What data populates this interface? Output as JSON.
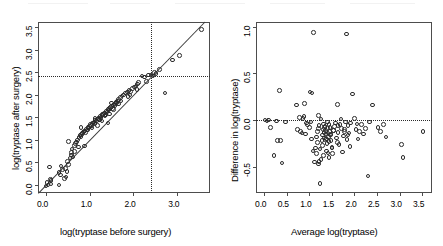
{
  "figure": {
    "title": "",
    "panels": [
      "scatter-before-after",
      "bland-altman"
    ]
  },
  "chart_data": [
    {
      "type": "scatter",
      "title": "",
      "xlabel": "log(tryptase before surgery)",
      "ylabel": "log(tryptase after surgery)",
      "xlim": [
        -0.18,
        3.75
      ],
      "ylim": [
        -0.18,
        3.62
      ],
      "xticks": [
        "0.0",
        "1.0",
        "2.0",
        "3.0"
      ],
      "xtick_values": [
        0.0,
        1.0,
        2.0,
        3.0
      ],
      "yticks": [
        "0.0",
        "0.5",
        "1.0",
        "1.5",
        "2.0",
        "2.5",
        "3.0",
        "3.5"
      ],
      "ytick_values": [
        0.0,
        0.5,
        1.0,
        1.5,
        2.0,
        2.5,
        3.0,
        3.5
      ],
      "grid": false,
      "legend": "none",
      "reference_lines": {
        "identity_line": {
          "slope": 1,
          "intercept": 0,
          "style": "solid"
        },
        "vertical_threshold": {
          "x": 2.4,
          "style": "dotted"
        },
        "horizontal_threshold": {
          "y": 2.43,
          "style": "dotted"
        }
      },
      "x": [
        0.0,
        0.03,
        0.05,
        0.08,
        0.1,
        0.12,
        0.3,
        0.33,
        0.38,
        0.42,
        0.45,
        0.48,
        0.5,
        0.52,
        0.55,
        0.58,
        0.6,
        0.62,
        0.65,
        0.68,
        0.7,
        0.72,
        0.74,
        0.76,
        0.78,
        0.8,
        0.82,
        0.84,
        0.86,
        0.88,
        0.9,
        0.92,
        0.94,
        0.96,
        0.98,
        1.0,
        1.02,
        1.04,
        1.06,
        1.08,
        1.1,
        1.12,
        1.14,
        1.16,
        1.18,
        1.2,
        1.22,
        1.24,
        1.26,
        1.28,
        1.3,
        1.32,
        1.34,
        1.36,
        1.38,
        1.4,
        1.42,
        1.44,
        1.46,
        1.48,
        1.5,
        1.52,
        1.54,
        1.56,
        1.58,
        1.6,
        1.62,
        1.64,
        1.66,
        1.7,
        1.74,
        1.78,
        1.82,
        1.86,
        1.9,
        1.94,
        1.98,
        2.02,
        2.06,
        2.1,
        2.2,
        2.3,
        2.4,
        2.45,
        2.52,
        2.6,
        2.72,
        2.9,
        3.05,
        3.55,
        0.52,
        0.8,
        1.12,
        1.5,
        1.22,
        0.95,
        1.05,
        1.35,
        1.62,
        2.12,
        0.35,
        0.66,
        1.45,
        1.72,
        2.26,
        0.58,
        1.28,
        1.55,
        1.88,
        2.34,
        0.46,
        0.88,
        1.18,
        1.42,
        1.66,
        1.92,
        2.08,
        2.48,
        0.12,
        0.3
      ],
      "y": [
        -0.02,
        0.05,
        0.0,
        0.4,
        0.12,
        0.02,
        0.0,
        0.22,
        0.34,
        0.14,
        0.36,
        0.3,
        0.52,
        0.45,
        0.6,
        0.72,
        0.8,
        0.62,
        0.88,
        0.92,
        0.95,
        1.0,
        0.84,
        1.05,
        1.1,
        1.08,
        1.12,
        1.15,
        1.18,
        1.2,
        1.16,
        1.24,
        1.22,
        1.28,
        1.26,
        1.3,
        1.34,
        1.32,
        1.36,
        1.38,
        1.4,
        1.35,
        1.44,
        1.42,
        1.46,
        1.48,
        1.45,
        1.52,
        1.5,
        1.54,
        1.56,
        1.58,
        1.6,
        1.55,
        1.64,
        1.62,
        1.68,
        1.66,
        1.7,
        1.72,
        1.74,
        1.7,
        1.78,
        1.8,
        1.76,
        1.84,
        1.82,
        1.86,
        1.9,
        1.94,
        1.98,
        2.0,
        2.04,
        2.06,
        2.1,
        2.08,
        2.14,
        2.18,
        2.2,
        2.24,
        2.42,
        2.3,
        2.44,
        2.42,
        2.48,
        2.56,
        2.04,
        2.78,
        2.88,
        3.45,
        0.96,
        1.28,
        1.48,
        1.82,
        1.44,
        1.22,
        1.26,
        1.54,
        1.84,
        2.28,
        0.42,
        0.74,
        1.58,
        1.86,
        2.4,
        0.66,
        1.42,
        1.68,
        1.96,
        2.44,
        0.18,
        0.86,
        1.32,
        1.38,
        1.8,
        2.0,
        2.12,
        2.5,
        0.1,
        0.28
      ]
    },
    {
      "type": "scatter",
      "title": "",
      "xlabel": "Average log(tryptase)",
      "ylabel": "Difference in log(tryptase)",
      "xlim": [
        -0.18,
        3.72
      ],
      "ylim": [
        -0.78,
        1.05
      ],
      "xticks": [
        "0.0",
        "0.5",
        "1.0",
        "1.5",
        "2.0",
        "2.5",
        "3.0",
        "3.5"
      ],
      "xtick_values": [
        0.0,
        0.5,
        1.0,
        1.5,
        2.0,
        2.5,
        3.0,
        3.5
      ],
      "yticks": [
        "-0.5",
        "0.0",
        "0.5",
        "1.0"
      ],
      "ytick_values": [
        -0.5,
        0.0,
        0.5,
        1.0
      ],
      "grid": false,
      "legend": "none",
      "reference_lines": {
        "zero_line": {
          "y": 0.0,
          "style": "dotted"
        }
      },
      "x": [
        0.02,
        0.06,
        0.1,
        0.14,
        0.22,
        0.3,
        0.34,
        0.36,
        0.4,
        0.48,
        0.72,
        0.74,
        0.78,
        0.8,
        0.84,
        0.86,
        0.9,
        0.92,
        0.96,
        1.0,
        1.02,
        1.04,
        1.06,
        1.08,
        1.1,
        1.12,
        1.14,
        1.16,
        1.18,
        1.2,
        1.21,
        1.22,
        1.24,
        1.26,
        1.28,
        1.3,
        1.31,
        1.32,
        1.33,
        1.34,
        1.35,
        1.36,
        1.37,
        1.38,
        1.39,
        1.4,
        1.41,
        1.42,
        1.43,
        1.44,
        1.45,
        1.46,
        1.47,
        1.48,
        1.5,
        1.52,
        1.54,
        1.56,
        1.58,
        1.6,
        1.62,
        1.64,
        1.66,
        1.68,
        1.7,
        1.72,
        1.74,
        1.76,
        1.78,
        1.8,
        1.82,
        1.84,
        1.86,
        1.88,
        1.9,
        1.92,
        1.96,
        2.0,
        2.04,
        2.08,
        2.12,
        2.16,
        2.2,
        2.24,
        2.3,
        2.34,
        2.4,
        2.52,
        2.58,
        2.64,
        2.7,
        3.04,
        3.08,
        3.52,
        1.18,
        1.24,
        1.3,
        1.36,
        1.42,
        1.5,
        1.26,
        1.32,
        1.38,
        1.44,
        1.2,
        1.16,
        1.34,
        1.48,
        1.54,
        1.64,
        0.88,
        0.94,
        1.05,
        1.62,
        1.78,
        1.86,
        2.06,
        0.28,
        1.22,
        1.44
      ],
      "y": [
        0.0,
        -0.01,
        0.0,
        -0.08,
        -0.38,
        -0.22,
        0.32,
        -0.22,
        -0.46,
        -0.02,
        0.16,
        -0.1,
        0.03,
        -0.12,
        -0.14,
        0.02,
        0.18,
        -0.15,
        -0.05,
        -0.08,
        0.3,
        -0.02,
        0.29,
        -0.33,
        0.94,
        -0.45,
        -0.3,
        -0.18,
        -0.12,
        -0.09,
        0.05,
        -0.06,
        -0.68,
        0.01,
        -0.22,
        -0.16,
        -0.1,
        -0.04,
        -0.13,
        -0.19,
        -0.07,
        -0.11,
        -0.15,
        -0.2,
        -0.25,
        -0.02,
        -0.09,
        -0.14,
        -0.18,
        -0.05,
        -0.12,
        -0.08,
        -0.16,
        -0.22,
        -0.3,
        -0.36,
        -0.11,
        -0.07,
        -0.03,
        -0.19,
        0.17,
        -0.13,
        -0.26,
        -0.05,
        0.01,
        -0.09,
        -0.34,
        -0.17,
        -0.12,
        -0.02,
        0.92,
        -0.21,
        -0.06,
        -0.14,
        -0.28,
        -0.03,
        0.28,
        0.02,
        -0.1,
        -0.2,
        -0.12,
        -0.05,
        -0.15,
        -0.09,
        -0.6,
        -0.02,
        0.16,
        -0.08,
        -0.12,
        -0.05,
        -0.18,
        -0.26,
        -0.4,
        -0.12,
        -0.24,
        -0.31,
        -0.27,
        -0.21,
        -0.35,
        -0.29,
        -0.42,
        -0.38,
        -0.33,
        -0.23,
        -0.47,
        -0.36,
        -0.08,
        -0.15,
        -0.11,
        -0.06,
        0.04,
        -0.03,
        -0.2,
        -0.24,
        -0.1,
        -0.16,
        -0.04,
        -0.01,
        -0.44,
        -0.4
      ]
    }
  ]
}
